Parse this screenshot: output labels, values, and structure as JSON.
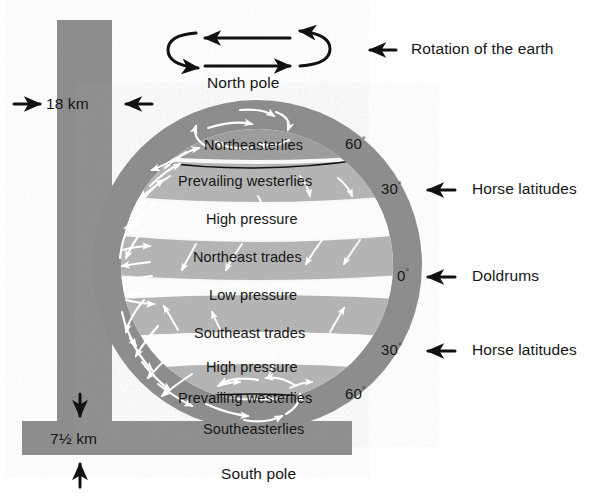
{
  "figure": {
    "type": "atmospheric-circulation-diagram",
    "title_visible": false
  },
  "poles": {
    "north": "North pole",
    "south": "South pole"
  },
  "rotation": {
    "label": "Rotation of the earth",
    "arrow_top_direction": "left",
    "arrow_bottom_direction": "right"
  },
  "thickness": {
    "top": {
      "value": "18 km",
      "left_arrow": "→",
      "right_arrow": "←"
    },
    "bottom": {
      "value": "7½ km",
      "top_arrow": "↓",
      "bottom_arrow": "↑"
    }
  },
  "bands": [
    {
      "label": "Northeasterlies",
      "tone": "mid"
    },
    {
      "label": "Prevailing westerlies",
      "tone": "mid"
    },
    {
      "label": "High pressure",
      "tone": "white"
    },
    {
      "label": "Northeast trades",
      "tone": "mid"
    },
    {
      "label": "Low pressure",
      "tone": "white"
    },
    {
      "label": "Southeast trades",
      "tone": "mid"
    },
    {
      "label": "High pressure",
      "tone": "white"
    },
    {
      "label": "Prevailing westerlies",
      "tone": "mid"
    },
    {
      "label": "Southeasterlies",
      "tone": "mid"
    }
  ],
  "latitudes": [
    {
      "value": "60",
      "unit": "°",
      "hemisphere": "north"
    },
    {
      "value": "30",
      "unit": "°",
      "hemisphere": "north"
    },
    {
      "value": "0",
      "unit": "°",
      "hemisphere": "equator"
    },
    {
      "value": "30",
      "unit": "°",
      "hemisphere": "south"
    },
    {
      "value": "60",
      "unit": "°",
      "hemisphere": "south"
    }
  ],
  "callouts": [
    {
      "label": "Horse latitudes",
      "latitude": "30° N",
      "arrow": "←"
    },
    {
      "label": "Doldrums",
      "latitude": "0°",
      "arrow": "←"
    },
    {
      "label": "Horse latitudes",
      "latitude": "30° S",
      "arrow": "←"
    }
  ],
  "colors": {
    "outer_ring": "#8d8d8d",
    "band_mid": "#b4b4b4",
    "band_white": "#fbfbfb",
    "bar_fill": "#8d8d8d",
    "ink": "#161616",
    "flow_arrow": "#ffffff",
    "background": "#ffffff"
  }
}
